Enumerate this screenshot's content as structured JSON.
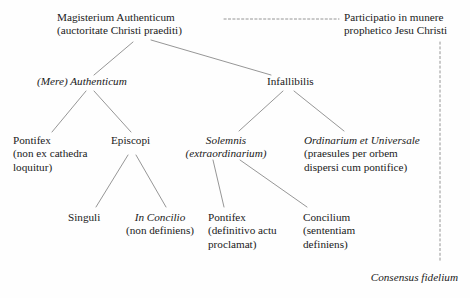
{
  "diagram": {
    "line_color": "#8a8a8a",
    "text_color": "#1a1a1a",
    "nodes": {
      "root": {
        "line1": "Magisterium Authenticum",
        "line2": "(auctoritate Christi praediti)"
      },
      "participatio": {
        "line1": "Participatio in munere",
        "line2": "prophetico Jesu Christi"
      },
      "mere_authenticum": {
        "line1": "(Mere) Authenticum"
      },
      "infallibilis": {
        "line1": "Infallibilis"
      },
      "pontifex_non_ex_cathedra": {
        "line1": "Pontifex",
        "line2": "(non ex cathedra",
        "line3": "loquitur)"
      },
      "episcopi": {
        "line1": "Episcopi"
      },
      "solemnis": {
        "line1": "Solemnis",
        "line2": "(extraordinarium)"
      },
      "ordinarium_et_universale": {
        "line1": "Ordinarium et Universale",
        "line2": "(praesules per orbem",
        "line3": "dispersi cum pontifice)"
      },
      "singuli": {
        "line1": "Singuli"
      },
      "in_concilio": {
        "line1": "In Concilio",
        "line2": "(non definiens)"
      },
      "pontifex_definitivo": {
        "line1": "Pontifex",
        "line2": "(definitivo actu",
        "line3": "proclamat)"
      },
      "concilium": {
        "line1": "Concilium",
        "line2": "(sententiam",
        "line3": "definiens)"
      },
      "consensus_fidelium": {
        "line1": "Consensus fidelium"
      }
    }
  }
}
